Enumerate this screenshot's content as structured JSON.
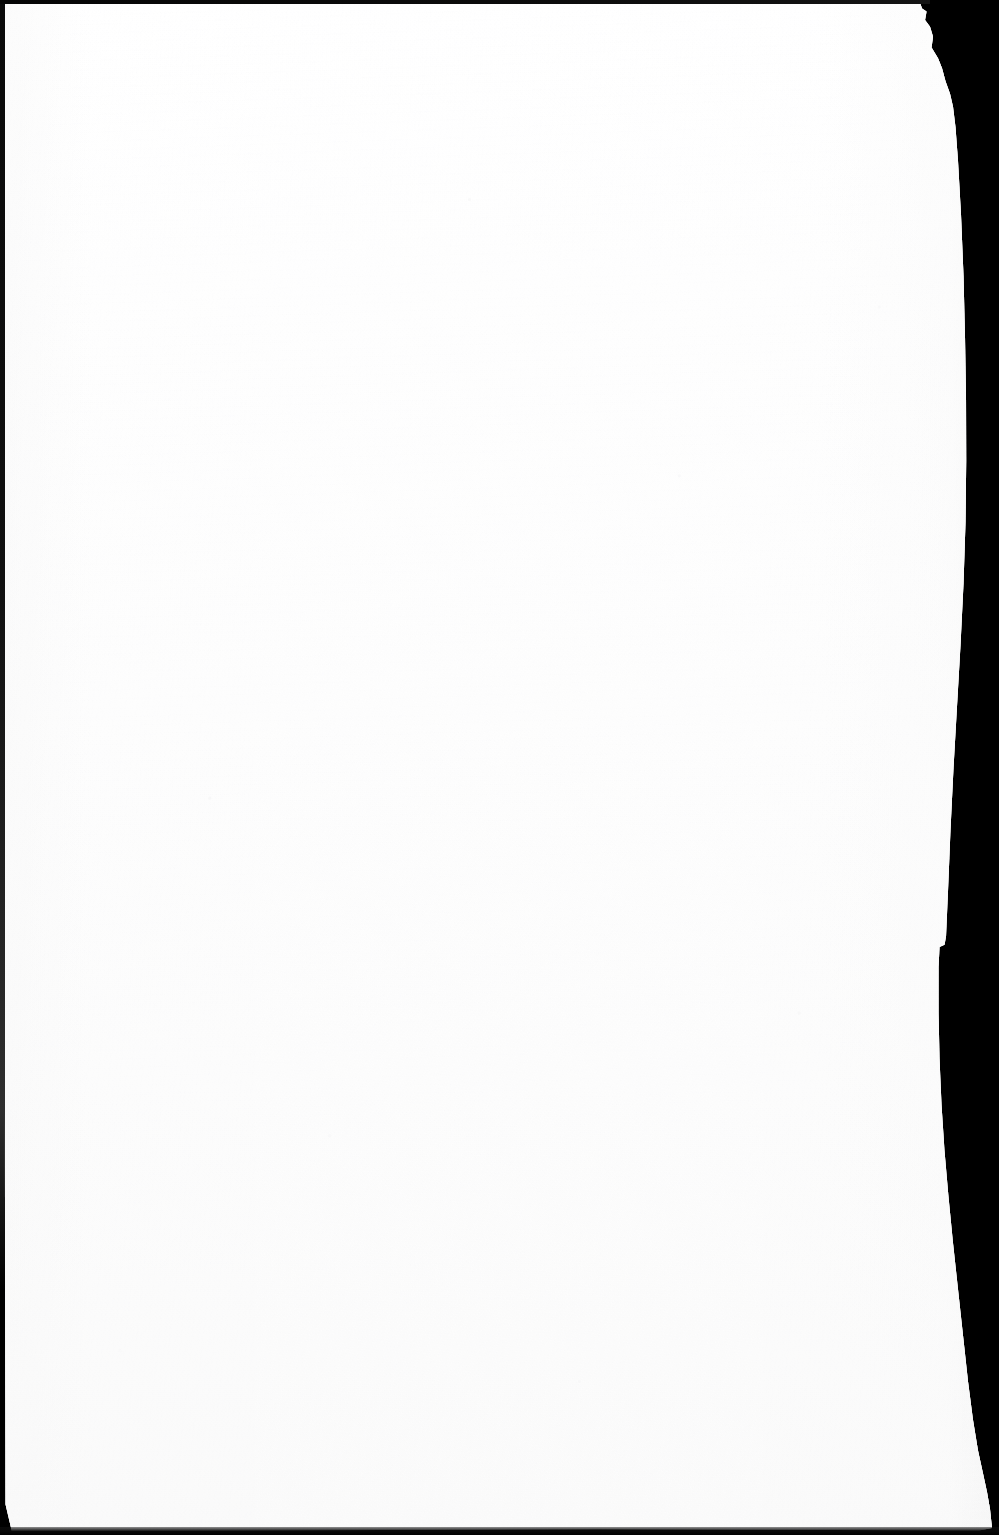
{
  "document": {
    "kind": "scanned-page",
    "page_label": "",
    "page_content_text": "",
    "is_blank": "true",
    "notes_text": ""
  },
  "scan": {
    "width_px": 999,
    "height_px": 1535,
    "background_color": "#000000",
    "paper_color": "#ffffff",
    "paper_shadow_color": "#fafafa",
    "border_color": "#0a0a0a",
    "orientation": "portrait"
  },
  "edges": {
    "left": {
      "name": "left-edge",
      "thickness_px": 5,
      "color": "#0a0a0a"
    },
    "top": {
      "name": "top-edge",
      "thickness_px": 4,
      "color": "#050505"
    },
    "bottom": {
      "name": "bottom-edge",
      "thickness_px": 8,
      "color": "#080808"
    },
    "right": {
      "name": "right-edge-torn",
      "description": "irregular curved torn edge",
      "color": "#000000"
    }
  }
}
